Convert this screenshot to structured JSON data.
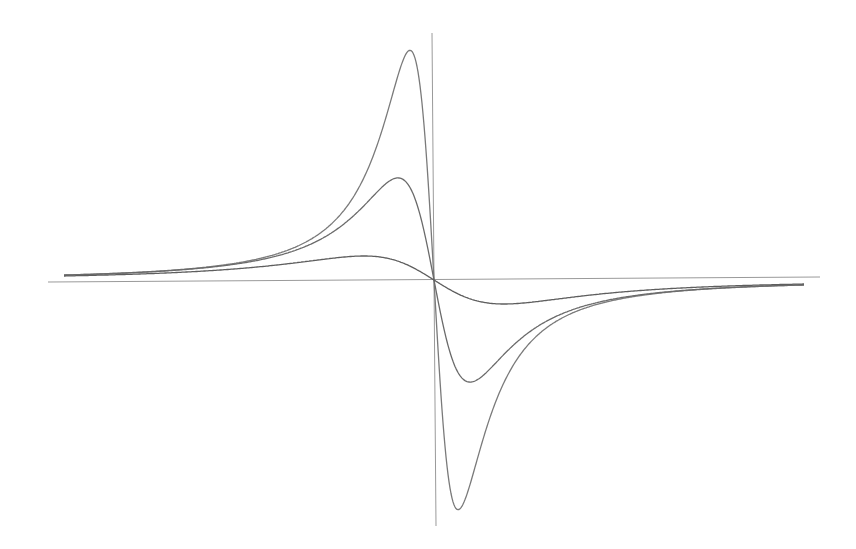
{
  "chart_data": {
    "type": "line",
    "title": "",
    "xlabel": "",
    "ylabel": "",
    "grid": false,
    "legend": null,
    "axes": {
      "origin_px": [
        434,
        280
      ],
      "x_axis_px": [
        48,
        820
      ],
      "y_axis_px": [
        33,
        526
      ],
      "color": "#9a9a9a"
    },
    "model": "y = -C·x / (x² + g²)^1.5 (antisymmetric dispersion-like curves, tails converge)",
    "x": [
      -370,
      -300,
      -250,
      -200,
      -150,
      -120,
      -100,
      -80,
      -70,
      -60,
      -50,
      -40,
      -36,
      -30,
      -24,
      -20,
      -10,
      -5,
      0,
      5,
      10,
      20,
      24,
      30,
      36,
      40,
      50,
      60,
      70,
      80,
      100,
      120,
      150,
      200,
      250,
      300,
      370
    ],
    "series": [
      {
        "name": "curve-narrow (g=34)",
        "color": "#7a7a7a",
        "values": [
          5.0,
          8.5,
          11.8,
          16.5,
          28.4,
          40.0,
          58.6,
          84.1,
          104.0,
          126.0,
          156.0,
          190.7,
          205.0,
          222.0,
          230.0,
          224.8,
          155.0,
          85.0,
          0,
          -85.0,
          -155.0,
          -224.8,
          -230.0,
          -222.0,
          -205.0,
          -190.7,
          -156.0,
          -126.0,
          -104.0,
          -84.1,
          -58.6,
          -40.0,
          -28.4,
          -16.5,
          -11.8,
          -8.5,
          -5.0
        ]
      },
      {
        "name": "curve-medium (g=51)",
        "color": "#6a6a6a",
        "values": [
          4.9,
          8.0,
          11.0,
          15.7,
          26.0,
          37.0,
          48.8,
          64.6,
          74.5,
          84.8,
          94.8,
          101.5,
          102.0,
          100.0,
          93.0,
          84.0,
          49.0,
          25.5,
          0,
          -25.5,
          -49.0,
          -84.0,
          -93.0,
          -100.0,
          -102.0,
          -101.5,
          -94.8,
          -84.8,
          -74.5,
          -64.6,
          -48.8,
          -37.0,
          -26.0,
          -15.7,
          -11.0,
          -8.0,
          -4.9
        ]
      },
      {
        "name": "curve-wide (g=99)",
        "color": "#5e5e5e",
        "values": [
          4.0,
          5.8,
          7.9,
          11.0,
          15.8,
          19.5,
          21.9,
          23.6,
          24.0,
          23.7,
          22.4,
          19.5,
          18.2,
          16.6,
          13.6,
          11.7,
          6.2,
          3.1,
          0,
          -3.1,
          -6.2,
          -11.7,
          -13.6,
          -16.6,
          -18.2,
          -19.5,
          -22.4,
          -23.7,
          -24.0,
          -23.6,
          -21.9,
          -19.5,
          -15.8,
          -11.0,
          -7.9,
          -5.8,
          -4.0
        ]
      }
    ]
  }
}
